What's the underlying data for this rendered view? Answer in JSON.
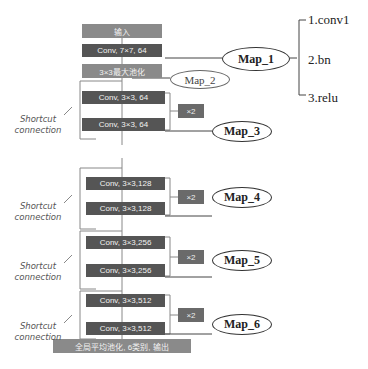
{
  "diagram": {
    "blocks": {
      "input": "输入",
      "conv1": "Conv, 7×7, 64",
      "pool": "3×3最大池化",
      "b1a": "Conv, 3×3, 64",
      "b1b": "Conv, 3×3, 64",
      "b2a": "Conv, 3×3,128",
      "b2b": "Conv, 3×3,128",
      "b3a": "Conv, 3×3,256",
      "b3b": "Conv, 3×3,256",
      "b4a": "Conv, 3×3,512",
      "b4b": "Conv, 3×3,512",
      "output": "全局平均池化, 6类别, 输出"
    },
    "repeat_label": "×2",
    "shortcut_label": [
      "Shortcut",
      "connection"
    ],
    "maps": [
      "Map_1",
      "Map_2",
      "Map_3",
      "Map_4",
      "Map_5",
      "Map_6"
    ],
    "map1_components": [
      "1.conv1",
      "2.bn",
      "3.relu"
    ]
  }
}
